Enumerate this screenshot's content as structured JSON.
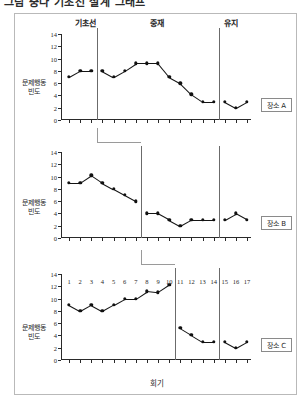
{
  "figure": {
    "title": "그림 중다 기초선 설계 그래프",
    "x_axis_title": "회기",
    "y_axis_title": "문제행동 빈도",
    "y_ticks": [
      0,
      2,
      4,
      6,
      8,
      10,
      12,
      14
    ],
    "y_min": 0,
    "y_max": 14,
    "x_ticks": [
      1,
      2,
      3,
      4,
      5,
      6,
      7,
      8,
      9,
      10,
      11,
      12,
      13,
      14,
      15,
      16,
      17
    ],
    "phases": [
      {
        "name": "기초선"
      },
      {
        "name": "중재"
      },
      {
        "name": "유지"
      }
    ]
  },
  "chart_data": {
    "type": "line",
    "title": "그림 중다 기초선 설계 그래프",
    "xlabel": "회기",
    "ylabel": "문제행동 빈도",
    "ylim": [
      0,
      14
    ],
    "xlim": [
      1,
      17
    ],
    "grid": false,
    "legend_position": "inline-right-box",
    "x": [
      1,
      2,
      3,
      4,
      5,
      6,
      7,
      8,
      9,
      10,
      11,
      12,
      13,
      14,
      15,
      16,
      17
    ],
    "panels": [
      {
        "label": "장소 A",
        "baseline_end_session": 3,
        "intervention_end_session": 14,
        "values": [
          7,
          8,
          8,
          8,
          7,
          8,
          9.2,
          9.2,
          9.2,
          7,
          6,
          4.2,
          3,
          3,
          3,
          2,
          3
        ]
      },
      {
        "label": "장소 B",
        "baseline_end_session": 7,
        "intervention_end_session": 14,
        "values": [
          9,
          9,
          10.2,
          9,
          8,
          7,
          6,
          4,
          4,
          3,
          2,
          3,
          3,
          3,
          3,
          4,
          3
        ]
      },
      {
        "label": "장소 C",
        "baseline_end_session": 10,
        "intervention_end_session": 14,
        "values": [
          9,
          8,
          9,
          8,
          9,
          10,
          10,
          11.2,
          11,
          12.2,
          5.2,
          4.1,
          3,
          3,
          3,
          2,
          3
        ]
      }
    ],
    "series": [
      {
        "name": "장소 A",
        "values": [
          7,
          8,
          8,
          8,
          7,
          8,
          9.2,
          9.2,
          9.2,
          7,
          6,
          4.2,
          3,
          3,
          3,
          2,
          3
        ]
      },
      {
        "name": "장소 B",
        "values": [
          9,
          9,
          10.2,
          9,
          8,
          7,
          6,
          4,
          4,
          3,
          2,
          3,
          3,
          3,
          3,
          4,
          3
        ]
      },
      {
        "name": "장소 C",
        "values": [
          9,
          8,
          9,
          8,
          9,
          10,
          10,
          11.2,
          11,
          12.2,
          5.2,
          4.1,
          3,
          3,
          3,
          2,
          3
        ]
      }
    ]
  }
}
